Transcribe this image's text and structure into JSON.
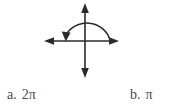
{
  "background_color": "#ffffff",
  "figure": {
    "name": "coordinate-axes-with-rotation-arc",
    "stroke_color": "#2b2b2b",
    "axes": {
      "x_axis": {
        "label": "",
        "start_arrow": true,
        "end_arrow": true,
        "x1": 45,
        "y1": 41,
        "x2": 118,
        "y2": 41
      },
      "y_axis": {
        "label": "",
        "start_arrow": true,
        "end_arrow": true,
        "x1": 85,
        "y1": 4,
        "x2": 85,
        "y2": 77
      },
      "origin": {
        "x": 85,
        "y": 41
      }
    },
    "arc": {
      "name": "rotation-arc",
      "direction": "counterclockwise-drawn-ending-at-negative-x-axis",
      "sweep_degrees": 180,
      "radius_x": 22,
      "radius_y": 23,
      "start": {
        "x": 110,
        "y": 40
      },
      "end": {
        "x": 67,
        "y": 40
      },
      "arrowhead_at": "end",
      "arrowhead_direction": "down-left"
    }
  },
  "answers": {
    "options": [
      {
        "letter": "a.",
        "value": "2π"
      },
      {
        "letter": "b.",
        "value": "π"
      }
    ]
  }
}
